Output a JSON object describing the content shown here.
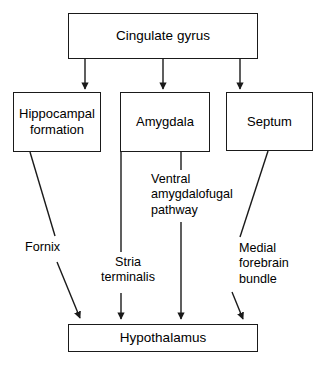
{
  "diagram": {
    "background_color": "#ffffff",
    "line_color": "#1a1a1a",
    "text_color": "#000000",
    "nodes": [
      {
        "id": "cingulate",
        "label": "Cingulate gyrus"
      },
      {
        "id": "hippocampal",
        "label": "Hippocampal\nformation"
      },
      {
        "id": "amygdala",
        "label": "Amygdala"
      },
      {
        "id": "septum",
        "label": "Septum"
      },
      {
        "id": "hypothalamus",
        "label": "Hypothalamus"
      }
    ],
    "edge_labels": [
      {
        "id": "fornix",
        "label": "Fornix"
      },
      {
        "id": "stria",
        "label": "Stria\nterminalis"
      },
      {
        "id": "ventral",
        "label": "Ventral\namygdalofugal\npathway"
      },
      {
        "id": "medial",
        "label": "Medial\nforebrain\nbundle"
      }
    ],
    "edges": [
      {
        "from": "cingulate",
        "to": "hippocampal",
        "label": ""
      },
      {
        "from": "cingulate",
        "to": "amygdala",
        "label": ""
      },
      {
        "from": "cingulate",
        "to": "septum",
        "label": ""
      },
      {
        "from": "hippocampal",
        "to": "hypothalamus",
        "label": "Fornix"
      },
      {
        "from": "amygdala",
        "to": "hypothalamus",
        "label": "Stria terminalis"
      },
      {
        "from": "amygdala",
        "to": "hypothalamus",
        "label": "Ventral amygdalofugal pathway"
      },
      {
        "from": "septum",
        "to": "hypothalamus",
        "label": "Medial forebrain bundle"
      }
    ]
  }
}
